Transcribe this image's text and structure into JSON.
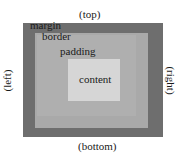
{
  "diagram": {
    "layers": [
      {
        "name": "margin",
        "label": "margin",
        "color": "#6e6e6e"
      },
      {
        "name": "border",
        "label": "border",
        "color": "#a9a9a9"
      },
      {
        "name": "padding",
        "label": "padding",
        "color": "#afafaf"
      },
      {
        "name": "content",
        "label": "content",
        "color": "#d6d6d6"
      }
    ],
    "sides": {
      "top": "(top)",
      "bottom": "(bottom)",
      "left": "(left)",
      "right": "(right)"
    }
  }
}
